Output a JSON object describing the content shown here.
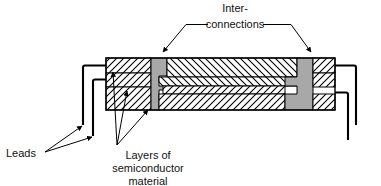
{
  "diagram": {
    "background_color": "#ffffff",
    "line_color": "#000000",
    "hatch_color": "#000000",
    "fill_color": "#ffffff",
    "metal_color": "#a8a8a8",
    "labels": {
      "interconnections": {
        "line1": "Inter-",
        "line2": "connections"
      },
      "leads": "Leads",
      "semiconductor": {
        "line1": "Layers of",
        "line2": "semiconductor",
        "line3": "material"
      }
    },
    "parts": {
      "body_outline": "package body cross-section",
      "left_block_layers": 3,
      "right_block_layers": 3,
      "center_layers": 4,
      "interconnection_count": 2,
      "lead_count": 4
    }
  }
}
